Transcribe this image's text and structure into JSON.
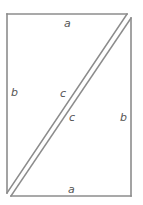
{
  "diagram": {
    "type": "two right triangles forming a rectangle",
    "colors": {
      "line": "#8c8c8c",
      "label": "#555555",
      "background": "#ffffff"
    },
    "triangles": [
      {
        "name": "upper-left-triangle",
        "vertices": [
          [
            7,
            14
          ],
          [
            127,
            14
          ],
          [
            7,
            193
          ]
        ],
        "labels": {
          "top": "a",
          "left": "b",
          "hypotenuse": "c"
        }
      },
      {
        "name": "lower-right-triangle",
        "vertices": [
          [
            131,
            18
          ],
          [
            131,
            196
          ],
          [
            11,
            196
          ]
        ],
        "labels": {
          "bottom": "a",
          "right": "b",
          "hypotenuse": "c"
        }
      }
    ],
    "labels": {
      "top_a": "a",
      "left_b": "b",
      "upper_c": "c",
      "lower_c": "c",
      "right_b": "b",
      "bottom_a": "a"
    }
  }
}
